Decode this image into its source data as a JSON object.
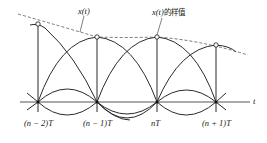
{
  "diagram": {
    "title": "",
    "signal_label": "x(t)",
    "samples_label_prefix": "x(t)",
    "samples_label_suffix": "的样值",
    "axis_label": "t",
    "tick_labels": [
      "(n − 2)T",
      "(n − 1)T",
      "nT",
      "(n + 1)T"
    ],
    "colors": {
      "stroke": "#2a2a2a",
      "dashed": "#555555",
      "background": "#ffffff"
    }
  }
}
